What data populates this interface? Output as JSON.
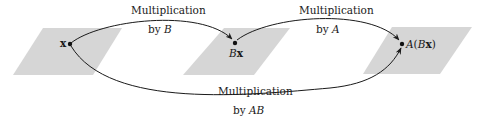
{
  "colors": {
    "plane_fill": "#d6d6d6",
    "arrow_stroke": "#1a1a1a",
    "text": "#1a1a1a",
    "background": "#ffffff"
  },
  "points": {
    "x": {
      "label": "x"
    },
    "bx": {
      "label_italic": "B",
      "label_bold": "x"
    },
    "abx": {
      "label_prefix_italic": "A",
      "label_open": "(",
      "label_italic": "B",
      "label_bold": "x",
      "label_close": ")"
    }
  },
  "arrows": {
    "by_b": {
      "line1": "Multiplication",
      "line2_prefix": "by ",
      "line2_matrix": "B"
    },
    "by_a": {
      "line1": "Multiplication",
      "line2_prefix": "by ",
      "line2_matrix": "A"
    },
    "by_ab": {
      "line1": "Multiplication",
      "line2_prefix": "by ",
      "line2_matrix": "AB"
    }
  }
}
